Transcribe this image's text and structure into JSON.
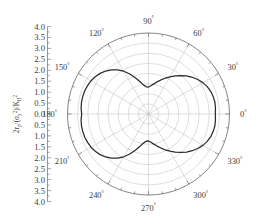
{
  "figure": {
    "type": "polar-plot",
    "background_color": "#ffffff",
    "curve_color": "#2b2b2b",
    "grid_color": "#bdbdbd",
    "axis_color": "#6a6a6a"
  },
  "y_axis": {
    "label_parts": {
      "lead": "2",
      "r": "r",
      "r_sub": "p",
      "sigma": "σ",
      "sigma_sub": "y",
      "sigma_sup": "2",
      "slash": "/",
      "K": "K",
      "K_sub": "II",
      "K_sup": "2",
      "open": "/(",
      "close": ")"
    },
    "label_text": "2r_p(σ_y²)/K_II²",
    "tick_labels": [
      "4.0",
      "3.5",
      "3.0",
      "2.5",
      "2.0",
      "1.5",
      "1.0",
      "0.5",
      "0.0",
      "0.5",
      "1.0",
      "1.5",
      "2.0",
      "2.5",
      "3.0",
      "3.5",
      "4.0"
    ]
  },
  "angle_labels": [
    {
      "text": "0",
      "degree_symbol": "°",
      "angle": 0
    },
    {
      "text": "30",
      "degree_symbol": "°",
      "angle": 30
    },
    {
      "text": "60",
      "degree_symbol": "°",
      "angle": 60
    },
    {
      "text": "90",
      "degree_symbol": "°",
      "angle": 90
    },
    {
      "text": "120",
      "degree_symbol": "°",
      "angle": 120
    },
    {
      "text": "150",
      "degree_symbol": "°",
      "angle": 150
    },
    {
      "text": "180",
      "degree_symbol": "°",
      "angle": 180
    },
    {
      "text": "210",
      "degree_symbol": "°",
      "angle": 210
    },
    {
      "text": "240",
      "degree_symbol": "°",
      "angle": 240
    },
    {
      "text": "270",
      "degree_symbol": "°",
      "angle": 270
    },
    {
      "text": "300",
      "degree_symbol": "°",
      "angle": 300
    },
    {
      "text": "330",
      "degree_symbol": "°",
      "angle": 330
    }
  ],
  "chart_data": {
    "type": "line",
    "subtype": "polar",
    "title": "",
    "xlabel": "",
    "ylabel": "2r_p(σ_y²)/K_II²",
    "rlim": [
      0,
      4.0
    ],
    "r_ticks": [
      0.5,
      1.0,
      1.5,
      2.0,
      2.5,
      3.0,
      3.5,
      4.0
    ],
    "theta_ticks": [
      0,
      30,
      60,
      90,
      120,
      150,
      180,
      210,
      240,
      270,
      300,
      330
    ],
    "theta_unit": "degrees",
    "theta_direction": "counterclockwise",
    "theta_zero_location": "E",
    "grid": true,
    "legend": null,
    "series": [
      {
        "name": "plastic zone boundary",
        "color": "#2b2b2b",
        "theta": [
          0,
          5,
          10,
          15,
          20,
          25,
          30,
          35,
          40,
          45,
          50,
          55,
          60,
          65,
          70,
          75,
          80,
          85,
          90,
          95,
          100,
          105,
          110,
          115,
          120,
          125,
          130,
          135,
          140,
          145,
          150,
          155,
          160,
          165,
          170,
          175,
          180,
          185,
          190,
          195,
          200,
          205,
          210,
          215,
          220,
          225,
          230,
          235,
          240,
          245,
          250,
          255,
          260,
          265,
          270,
          275,
          280,
          285,
          290,
          295,
          300,
          305,
          310,
          315,
          320,
          325,
          330,
          335,
          340,
          345,
          350,
          355,
          360
        ],
        "r": [
          3.3,
          3.32,
          3.33,
          3.31,
          3.27,
          3.2,
          3.1,
          2.97,
          2.82,
          2.66,
          2.48,
          2.3,
          2.12,
          1.95,
          1.79,
          1.64,
          1.51,
          1.4,
          1.33,
          1.35,
          1.46,
          1.66,
          1.91,
          2.18,
          2.44,
          2.66,
          2.85,
          3.0,
          3.12,
          3.21,
          3.28,
          3.32,
          3.35,
          3.36,
          3.36,
          3.34,
          3.3,
          3.34,
          3.36,
          3.36,
          3.35,
          3.32,
          3.28,
          3.21,
          3.12,
          3.0,
          2.85,
          2.66,
          2.44,
          2.18,
          1.91,
          1.66,
          1.46,
          1.35,
          1.33,
          1.4,
          1.51,
          1.64,
          1.79,
          1.95,
          2.12,
          2.3,
          2.48,
          2.66,
          2.82,
          2.97,
          3.1,
          3.2,
          3.27,
          3.31,
          3.33,
          3.32,
          3.3
        ]
      }
    ]
  }
}
